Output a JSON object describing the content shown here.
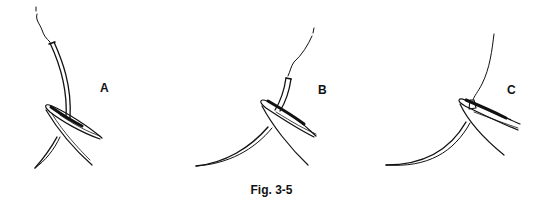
{
  "figure": {
    "caption": "Fig. 3-5",
    "panels": [
      {
        "id": "A",
        "label": "A",
        "description": "Needle held near the swaged end, long pointed tip below jaws"
      },
      {
        "id": "B",
        "label": "B",
        "description": "Needle held at mid-shaft"
      },
      {
        "id": "C",
        "label": "C",
        "description": "Needle held close to the swage, curved body below jaws"
      }
    ],
    "colors": {
      "line": "#111111",
      "background": "#ffffff"
    }
  }
}
